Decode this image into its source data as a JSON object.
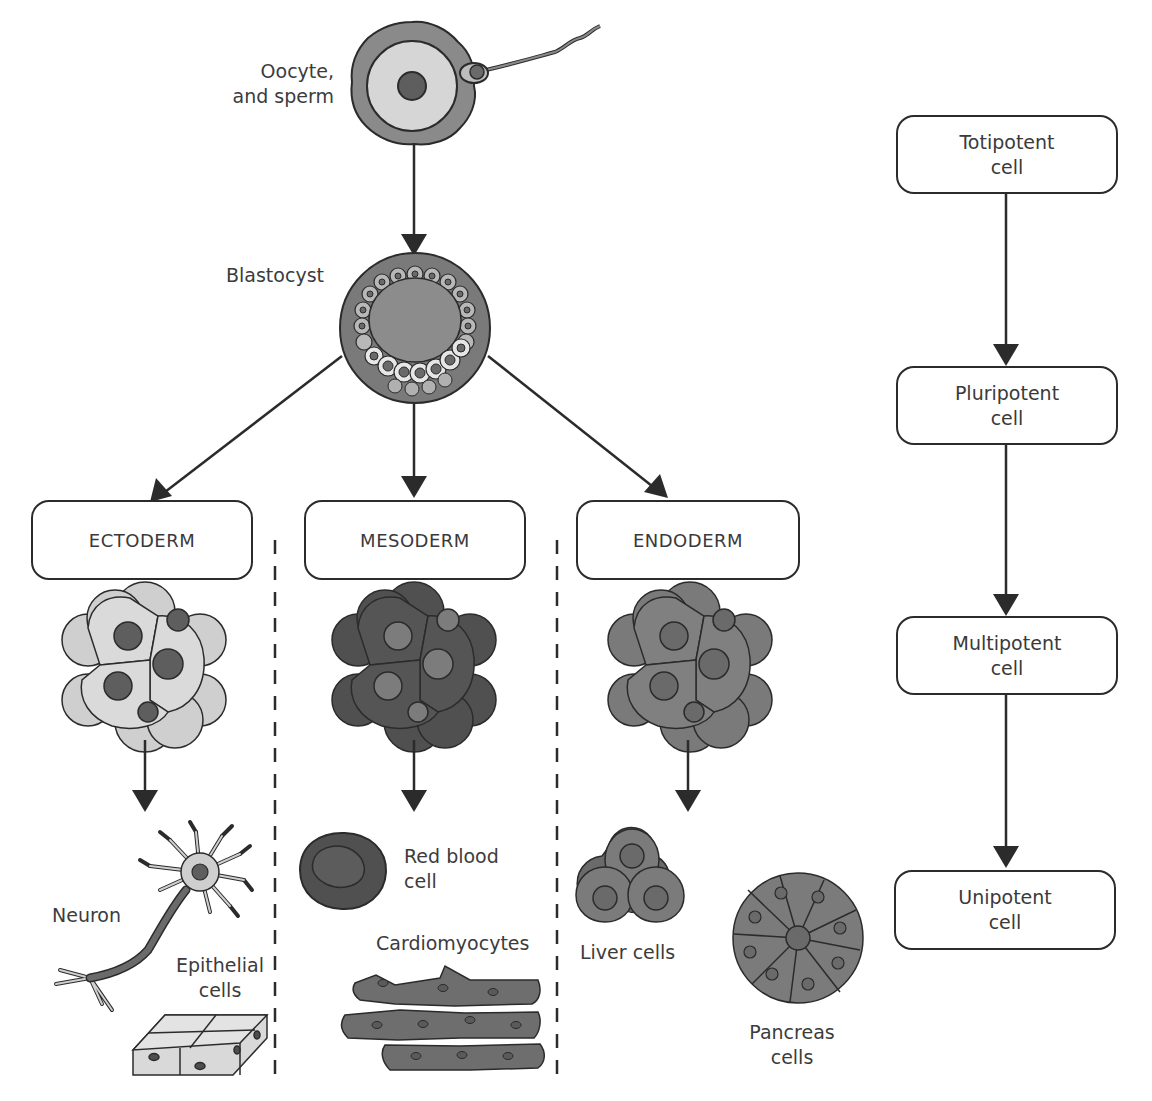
{
  "diagram": {
    "top": {
      "oocyte_label_line1": "Oocyte,",
      "oocyte_label_line2": "and sperm",
      "blastocyst_label": "Blastocyst"
    },
    "germ_layers": [
      {
        "name": "ECTODERM",
        "fill": "#d2d2d2",
        "nucleus": "#6a6a6a"
      },
      {
        "name": "MESODERM",
        "fill": "#4e4e4e",
        "nucleus": "#7a7a7a"
      },
      {
        "name": "ENDODERM",
        "fill": "#7d7d7d",
        "nucleus": "#6a6a6a"
      }
    ],
    "derived_cells": {
      "ectoderm": [
        {
          "label": "Neuron"
        },
        {
          "label_line1": "Epithelial",
          "label_line2": "cells"
        }
      ],
      "mesoderm": [
        {
          "label_line1": "Red blood",
          "label_line2": "cell"
        },
        {
          "label": "Cardiomyocytes"
        }
      ],
      "endoderm": [
        {
          "label": "Liver cells"
        },
        {
          "label_line1": "Pancreas",
          "label_line2": "cells"
        }
      ]
    },
    "potency_hierarchy": [
      {
        "line1": "Totipotent",
        "line2": "cell"
      },
      {
        "line1": "Pluripotent",
        "line2": "cell"
      },
      {
        "line1": "Multipotent",
        "line2": "cell"
      },
      {
        "line1": "Unipotent",
        "line2": "cell"
      }
    ],
    "colors": {
      "stroke": "#2b2b2b",
      "arrow": "#2b2b2b",
      "light_cell": "#d6d6d6",
      "mid_cell": "#7f7f7f",
      "dark_cell": "#4f4f4f"
    }
  }
}
